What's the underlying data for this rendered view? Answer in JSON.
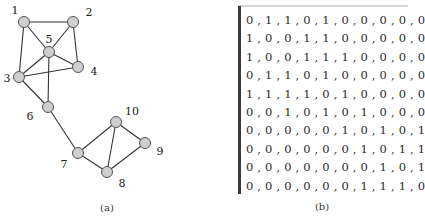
{
  "figure": {
    "panel_a": {
      "caption": "(a)",
      "node_fill": "#cfcfcf",
      "node_stroke": "#555555",
      "edge_color": "#333333",
      "nodes": [
        {
          "id": "1",
          "x": 24,
          "y": 22,
          "label_x": 15,
          "label_y": 10
        },
        {
          "id": "2",
          "x": 73,
          "y": 22,
          "label_x": 89,
          "label_y": 12
        },
        {
          "id": "3",
          "x": 19,
          "y": 77,
          "label_x": 7,
          "label_y": 78
        },
        {
          "id": "4",
          "x": 78,
          "y": 67,
          "label_x": 94,
          "label_y": 71
        },
        {
          "id": "5",
          "x": 49,
          "y": 52,
          "label_x": 49,
          "label_y": 39
        },
        {
          "id": "6",
          "x": 48,
          "y": 107,
          "label_x": 30,
          "label_y": 116
        },
        {
          "id": "7",
          "x": 78,
          "y": 153,
          "label_x": 64,
          "label_y": 164
        },
        {
          "id": "8",
          "x": 107,
          "y": 172,
          "label_x": 122,
          "label_y": 183
        },
        {
          "id": "9",
          "x": 145,
          "y": 143,
          "label_x": 160,
          "label_y": 151
        },
        {
          "id": "10",
          "x": 116,
          "y": 122,
          "label_x": 132,
          "label_y": 111
        }
      ],
      "edges": [
        [
          "1",
          "2"
        ],
        [
          "1",
          "3"
        ],
        [
          "1",
          "5"
        ],
        [
          "2",
          "4"
        ],
        [
          "2",
          "5"
        ],
        [
          "3",
          "4"
        ],
        [
          "3",
          "5"
        ],
        [
          "3",
          "6"
        ],
        [
          "4",
          "5"
        ],
        [
          "5",
          "6"
        ],
        [
          "6",
          "7"
        ],
        [
          "7",
          "8"
        ],
        [
          "7",
          "10"
        ],
        [
          "8",
          "9"
        ],
        [
          "8",
          "10"
        ],
        [
          "9",
          "10"
        ]
      ]
    },
    "panel_b": {
      "caption": "(b)",
      "rows": [
        "0 , 1 , 1 , 0 , 1 , 0 , 0 , 0 , 0 , 0",
        "1 , 0 , 0 , 1 , 1 , 0 , 0 , 0 , 0 , 0",
        "1 , 0 , 0 , 1 , 1 , 1 , 0 , 0 , 0 , 0",
        "0 , 1 , 1 , 0 , 1 , 0 , 0 , 0 , 0 , 0",
        "1 , 1 , 1 , 1 , 0 , 1 , 0 , 0 , 0 , 0",
        "0 , 0 , 1 , 0 , 1 , 0 , 1 , 0 , 0 , 0",
        "0 , 0 , 0 , 0 , 0 , 1 , 0 , 1 , 0 , 1",
        "0 , 0 , 0 , 0 , 0 , 0 , 1 , 0 , 1 , 1",
        "0 , 0 , 0 , 0 , 0 , 0 , 0 , 1 , 0 , 1",
        "0 , 0 , 0 , 0 , 0 , 0 , 1 , 1 , 1 , 0"
      ]
    }
  }
}
